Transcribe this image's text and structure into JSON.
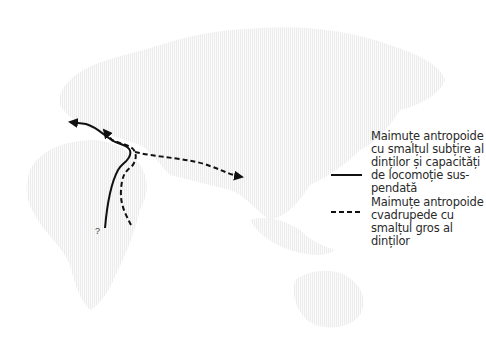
{
  "map": {
    "land_color": "#f4f4f4",
    "route_color": "#111111",
    "regions": [
      "europe",
      "africa",
      "asia",
      "australia"
    ]
  },
  "routes": [
    {
      "name": "thin-enamel-route",
      "style": "solid",
      "from": "east-africa",
      "to": "europe"
    },
    {
      "name": "thick-enamel-route-west",
      "style": "dashed",
      "from": "east-africa",
      "to": "europe"
    },
    {
      "name": "thick-enamel-route-east",
      "style": "dashed",
      "from": "east-africa",
      "to": "asia"
    }
  ],
  "annotations": {
    "origin_question": "?"
  },
  "legend": {
    "items": [
      {
        "style": "solid",
        "label_lines": [
          "Maimuțe antropoide",
          "cu smalțul subțire al",
          "dinților și capacități",
          "de locomoție sus-",
          "pendată"
        ]
      },
      {
        "style": "dashed",
        "label_lines": [
          "Maimuțe antropoide",
          "cvadrupede cu",
          "smalțul gros al",
          "dinților"
        ]
      }
    ]
  }
}
